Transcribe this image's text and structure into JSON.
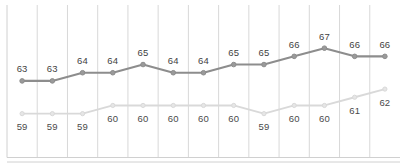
{
  "chart_data": {
    "type": "line",
    "title": "",
    "subtitle": "",
    "xlabel": "",
    "ylabel": "",
    "grid": true,
    "grid_orientation": "vertical",
    "legend": "none",
    "ylim": [
      57,
      68
    ],
    "xlim": [
      0,
      13
    ],
    "categories": [
      "1",
      "2",
      "3",
      "4",
      "5",
      "6",
      "7",
      "8",
      "9",
      "10",
      "11",
      "12",
      "13"
    ],
    "series": [
      {
        "name": "upper-series",
        "color": "#8d8d8d",
        "marker": "circle",
        "values": [
          63,
          63,
          64,
          64,
          65,
          64,
          64,
          65,
          65,
          66,
          67,
          66,
          66
        ],
        "labels": [
          "63",
          "63",
          "64",
          "64",
          "65",
          "64",
          "64",
          "65",
          "65",
          "66",
          "67",
          "66",
          "66"
        ],
        "label_position": "above"
      },
      {
        "name": "lower-series",
        "color": "#d9d9d9",
        "marker": "circle",
        "values": [
          59,
          59,
          59,
          60,
          60,
          60,
          60,
          60,
          59,
          60,
          60,
          61,
          62
        ],
        "labels": [
          "59",
          "59",
          "59",
          "60",
          "60",
          "60",
          "60",
          "60",
          "59",
          "60",
          "60",
          "61",
          "62"
        ],
        "label_position": "below"
      }
    ],
    "axis_line_color": "#d0d0d0",
    "gridline_color": "#d8d8d8",
    "background": "#ffffff"
  }
}
